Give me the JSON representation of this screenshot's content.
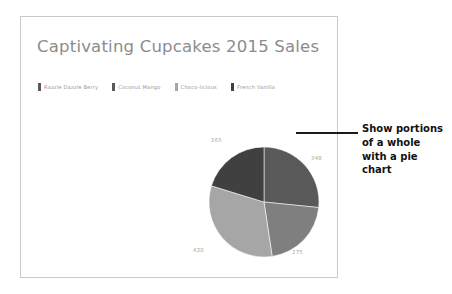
{
  "slide": {
    "title": "Captivating Cupcakes 2015 Sales"
  },
  "callout": {
    "text": "Show portions of a whole with a pie chart"
  },
  "chart_data": {
    "type": "pie",
    "title": "Captivating Cupcakes 2015 Sales",
    "categories": [
      "Razzle Dazzle Berry",
      "Coconut Mango",
      "Choco-licious",
      "French Vanilla"
    ],
    "values": [
      348,
      275,
      420,
      265
    ],
    "labels": [
      "348",
      "275",
      "420",
      "265"
    ],
    "total": 1308,
    "legend_position": "top",
    "grid": false,
    "colors": [
      "#595959",
      "#7f7f7f",
      "#a6a6a6",
      "#404040"
    ],
    "slices": [
      {
        "label": "348",
        "value": 348,
        "category": "Razzle Dazzle Berry",
        "color": "#595959"
      },
      {
        "label": "275",
        "value": 275,
        "category": "Coconut Mango",
        "color": "#7f7f7f"
      },
      {
        "label": "420",
        "value": 420,
        "category": "Choco-licious",
        "color": "#a6a6a6"
      },
      {
        "label": "265",
        "value": 265,
        "category": "French Vanilla",
        "color": "#404040"
      }
    ]
  },
  "legend": {
    "items": [
      {
        "label": "Razzle Dazzle Berry",
        "color": "#595959"
      },
      {
        "label": "Coconut Mango",
        "color": "#595959"
      },
      {
        "label": "Choco-licious",
        "color": "#a6a6a6"
      },
      {
        "label": "French Vanilla",
        "color": "#404040"
      }
    ]
  }
}
